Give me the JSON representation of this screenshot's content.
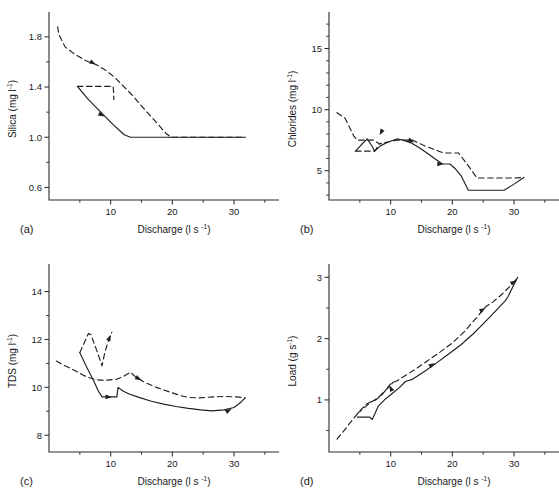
{
  "figure": {
    "xlabel": "Discharge",
    "xunit_main": "(l s",
    "xunit_sup": "-1",
    "xunit_close": ")",
    "panels": [
      {
        "id": "(a)",
        "key": "a",
        "ylabel_text": "Silica  (mg l",
        "ylabel_sup": "-1",
        "ylabel_close": ")"
      },
      {
        "id": "(b)",
        "key": "b",
        "ylabel_text": "Chlorides  (mg l",
        "ylabel_sup": "-1",
        "ylabel_close": ")"
      },
      {
        "id": "(c)",
        "key": "c",
        "ylabel_text": "TDS  (mg l",
        "ylabel_sup": "-1",
        "ylabel_close": ")"
      },
      {
        "id": "(d)",
        "key": "d",
        "ylabel_text": "Load  (g s",
        "ylabel_sup": "-1",
        "ylabel_close": ")"
      }
    ]
  },
  "chart_data": [
    {
      "panel": "(a)",
      "type": "line",
      "title": "",
      "xlabel": "Discharge (l s-1)",
      "ylabel": "Silica (mg l-1)",
      "xlim": [
        0,
        36
      ],
      "ylim": [
        0.5,
        1.95
      ],
      "xticks": [
        10,
        20,
        30
      ],
      "xticklabels": [
        "10",
        "20",
        "30"
      ],
      "xminorticks": [
        5,
        15,
        25,
        35
      ],
      "yticks": [
        0.6,
        1.0,
        1.4,
        1.8
      ],
      "yticklabels": [
        "0.6",
        "1.0",
        "1.4",
        "1.8"
      ],
      "yminorticks": [
        0.8,
        1.2,
        1.6
      ],
      "grid": false,
      "legend": "none",
      "series": [
        {
          "name": "falling limb",
          "style": "dashed",
          "x": [
            1.4,
            1.6,
            2.6,
            4.2,
            6.0,
            7.6,
            9.0,
            10.6,
            12.0,
            13.6,
            15.0,
            17.0,
            19.0,
            19.8,
            22.0,
            25.0,
            28.0,
            30.0,
            31.8
          ],
          "y": [
            1.88,
            1.82,
            1.72,
            1.66,
            1.61,
            1.58,
            1.54,
            1.48,
            1.41,
            1.33,
            1.25,
            1.14,
            1.03,
            1.0,
            1.0,
            1.0,
            1.0,
            1.0,
            1.0
          ]
        },
        {
          "name": "falling limb loop",
          "style": "dashed",
          "x": [
            4.6,
            7.0,
            9.4,
            10.4,
            10.5,
            10.5
          ],
          "y": [
            1.405,
            1.405,
            1.405,
            1.405,
            1.34,
            1.3
          ]
        },
        {
          "name": "rising limb",
          "style": "solid",
          "x": [
            4.6,
            6.4,
            8.6,
            10.4,
            12.2,
            13.2,
            16.0,
            20.0,
            24.0,
            28.0,
            31.8
          ],
          "y": [
            1.405,
            1.3,
            1.19,
            1.1,
            1.02,
            1.0,
            1.0,
            1.0,
            1.0,
            1.0,
            1.0
          ]
        }
      ],
      "arrows": [
        {
          "x": 7.6,
          "y": 1.58,
          "dir": "right-down",
          "series": "falling limb"
        },
        {
          "x": 9.0,
          "y": 1.165,
          "dir": "right-down",
          "series": "rising limb"
        }
      ]
    },
    {
      "panel": "(b)",
      "type": "line",
      "title": "",
      "xlabel": "Discharge (l s-1)",
      "ylabel": "Chlorides (mg l-1)",
      "xlim": [
        0,
        36
      ],
      "ylim": [
        2.6,
        17.5
      ],
      "xticks": [
        10,
        20,
        30
      ],
      "xticklabels": [
        "10",
        "20",
        "30"
      ],
      "xminorticks": [
        5,
        15,
        25,
        35
      ],
      "yticks": [
        5,
        10,
        15
      ],
      "yticklabels": [
        "5",
        "10",
        "15"
      ],
      "yminorticks": [
        3,
        4,
        6,
        7,
        8,
        9,
        11,
        12,
        13,
        14,
        16,
        17
      ],
      "grid": false,
      "legend": "none",
      "series": [
        {
          "name": "falling limb",
          "style": "dashed",
          "x": [
            1.3,
            2.6,
            4.0,
            4.6,
            5.2,
            6.4,
            7.2,
            8.2,
            9.6,
            11.0,
            12.4,
            13.6,
            15.2,
            17.0,
            18.6,
            19.6,
            21.0,
            22.6,
            24.0,
            27.0,
            30.0,
            31.6
          ],
          "y": [
            9.75,
            9.3,
            7.85,
            7.5,
            7.5,
            7.5,
            7.5,
            7.2,
            7.35,
            7.5,
            7.5,
            7.5,
            7.1,
            6.75,
            6.45,
            6.45,
            6.45,
            5.4,
            4.4,
            4.4,
            4.4,
            4.45
          ]
        },
        {
          "name": "falling limb low loop",
          "style": "dashed",
          "x": [
            4.3,
            5.4,
            6.6,
            7.4,
            8.2
          ],
          "y": [
            6.6,
            6.6,
            6.6,
            6.6,
            7.2
          ]
        },
        {
          "name": "rising limb",
          "style": "solid",
          "x": [
            4.3,
            5.2,
            6.2,
            7.0,
            7.4,
            8.4,
            9.6,
            11.0,
            12.0,
            13.2,
            14.6,
            16.0,
            17.4,
            18.4,
            19.6,
            20.4,
            21.4,
            22.6,
            25.0,
            28.4,
            30.0,
            31.6
          ],
          "y": [
            6.6,
            7.1,
            7.6,
            7.0,
            6.6,
            7.05,
            7.35,
            7.6,
            7.5,
            7.3,
            6.9,
            6.4,
            5.9,
            5.55,
            5.55,
            5.2,
            4.6,
            3.4,
            3.4,
            3.4,
            3.9,
            4.45
          ]
        }
      ],
      "arrows": [
        {
          "x": 8.2,
          "y": 7.9,
          "dir": "down-left",
          "series": "falling limb"
        },
        {
          "x": 13.8,
          "y": 7.3,
          "dir": "right-down",
          "series": "falling limb"
        },
        {
          "x": 18.6,
          "y": 5.55,
          "dir": "right",
          "series": "rising limb"
        }
      ]
    },
    {
      "panel": "(c)",
      "type": "line",
      "title": "",
      "xlabel": "Discharge (l s-1)",
      "ylabel": "TDS (mg l-1)",
      "xlim": [
        0,
        36
      ],
      "ylim": [
        7.3,
        14.9
      ],
      "xticks": [
        10,
        20,
        30
      ],
      "xticklabels": [
        "10",
        "20",
        "30"
      ],
      "xminorticks": [
        5,
        15,
        25,
        35
      ],
      "yticks": [
        8,
        10,
        12,
        14
      ],
      "yticklabels": [
        "8",
        "10",
        "12",
        "14"
      ],
      "yminorticks": [
        9,
        11,
        13
      ],
      "grid": false,
      "legend": "none",
      "series": [
        {
          "name": "falling limb",
          "style": "dashed",
          "x": [
            1.2,
            2.6,
            4.2,
            5.6,
            6.8,
            8.2,
            9.4,
            11.0,
            12.0,
            13.2,
            14.2,
            15.6,
            17.4,
            19.4,
            21.4,
            22.6,
            24.4,
            26.6,
            28.6,
            30.4,
            31.8
          ],
          "y": [
            11.1,
            10.9,
            10.7,
            10.5,
            10.38,
            10.3,
            10.3,
            10.34,
            10.45,
            10.63,
            10.4,
            10.2,
            10.0,
            9.82,
            9.65,
            9.58,
            9.56,
            9.6,
            9.62,
            9.6,
            9.56
          ]
        },
        {
          "name": "falling limb spike",
          "style": "dashed",
          "x": [
            5.0,
            6.4,
            6.8,
            7.8,
            8.6,
            9.0,
            9.4,
            10.0,
            10.2
          ],
          "y": [
            11.45,
            12.25,
            12.2,
            11.5,
            10.9,
            11.4,
            11.75,
            12.2,
            12.3
          ]
        },
        {
          "name": "rising limb",
          "style": "solid",
          "x": [
            5.0,
            6.0,
            7.2,
            8.0,
            8.6,
            10.2,
            11.0,
            11.2,
            12.0,
            13.0,
            14.6,
            16.6,
            18.6,
            20.6,
            22.6,
            24.6,
            26.4,
            28.4,
            30.0,
            31.2,
            31.8
          ],
          "y": [
            11.45,
            10.9,
            10.3,
            9.85,
            9.6,
            9.6,
            9.6,
            10.0,
            9.85,
            9.72,
            9.58,
            9.42,
            9.3,
            9.2,
            9.12,
            9.06,
            9.02,
            9.06,
            9.16,
            9.4,
            9.55
          ]
        }
      ],
      "arrows": [
        {
          "x": 10.0,
          "y": 12.2,
          "dir": "up-right",
          "series": "falling limb spike"
        },
        {
          "x": 15.0,
          "y": 10.3,
          "dir": "right-down",
          "series": "falling limb"
        },
        {
          "x": 10.2,
          "y": 9.6,
          "dir": "right",
          "series": "rising limb"
        },
        {
          "x": 29.6,
          "y": 9.1,
          "dir": "right-up",
          "series": "rising limb"
        }
      ]
    },
    {
      "panel": "(d)",
      "type": "line",
      "title": "",
      "xlabel": "Discharge (l s-1)",
      "ylabel": "Load (g s-1)",
      "xlim": [
        0,
        36
      ],
      "ylim": [
        0.15,
        3.12
      ],
      "xticks": [
        10,
        20,
        30
      ],
      "xticklabels": [
        "10",
        "20",
        "30"
      ],
      "xminorticks": [
        5,
        15,
        25,
        35
      ],
      "yticks": [
        1,
        2,
        3
      ],
      "yticklabels": [
        "1",
        "2",
        "3"
      ],
      "yminorticks": [
        0.5,
        1.5,
        2.5
      ],
      "grid": false,
      "legend": "none",
      "series": [
        {
          "name": "falling limb",
          "style": "dashed",
          "x": [
            1.3,
            2.6,
            4.0,
            5.2,
            6.0,
            6.8,
            7.6,
            8.4,
            9.2,
            9.8,
            10.2,
            11.0,
            12.4,
            14.0,
            16.0,
            18.0,
            20.0,
            22.0,
            24.0,
            25.4,
            26.6,
            28.0,
            29.4,
            30.6
          ],
          "y": [
            0.36,
            0.52,
            0.7,
            0.84,
            0.93,
            0.97,
            1.0,
            1.06,
            1.16,
            1.24,
            1.28,
            1.31,
            1.4,
            1.5,
            1.64,
            1.78,
            1.93,
            2.12,
            2.35,
            2.52,
            2.6,
            2.72,
            2.86,
            3.0
          ]
        },
        {
          "name": "falling limb inner",
          "style": "dashed",
          "x": [
            4.6,
            5.6,
            6.6,
            7.4,
            8.2,
            9.2,
            10.0,
            10.4
          ],
          "y": [
            0.78,
            0.86,
            0.95,
            1.0,
            1.06,
            1.16,
            1.24,
            1.29
          ]
        },
        {
          "name": "rising limb",
          "style": "solid",
          "x": [
            4.6,
            5.6,
            6.6,
            7.0,
            7.2,
            8.0,
            9.0,
            10.2,
            11.4,
            12.4,
            13.6,
            15.4,
            17.4,
            19.4,
            21.4,
            23.4,
            25.2,
            27.0,
            28.6,
            29.0,
            29.6,
            30.6
          ],
          "y": [
            0.72,
            0.72,
            0.72,
            0.68,
            0.72,
            0.9,
            1.0,
            1.1,
            1.2,
            1.3,
            1.34,
            1.46,
            1.6,
            1.75,
            1.9,
            2.08,
            2.26,
            2.45,
            2.62,
            2.68,
            2.8,
            3.0
          ]
        }
      ],
      "arrows": [
        {
          "x": 9.8,
          "y": 1.24,
          "dir": "up-left",
          "series": "falling limb"
        },
        {
          "x": 17.2,
          "y": 1.6,
          "dir": "right-up",
          "series": "rising limb"
        },
        {
          "x": 25.4,
          "y": 2.5,
          "dir": "right-up",
          "series": "falling limb"
        },
        {
          "x": 30.4,
          "y": 2.95,
          "dir": "right-up",
          "series": "falling limb"
        }
      ]
    }
  ]
}
